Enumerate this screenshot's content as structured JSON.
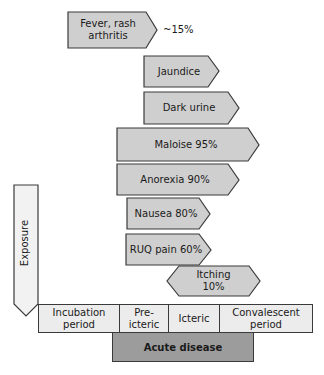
{
  "diagram": {
    "symptoms": [
      {
        "label": "Fever, rash\narthritis",
        "line1": "Fever, rash",
        "line2": "arthritis",
        "annotation": "~15%"
      },
      {
        "label": "Jaundice"
      },
      {
        "label": "Dark urine"
      },
      {
        "label": "Maloise 95%"
      },
      {
        "label": "Anorexia 90%"
      },
      {
        "label": "Nausea 80%"
      },
      {
        "label": "RUQ pain 60%"
      },
      {
        "label": "Itching 10%",
        "line1": "Itching",
        "line2": "10%"
      }
    ],
    "exposure": {
      "label": "Exposure"
    },
    "timeline": [
      {
        "line1": "Incubation",
        "line2": "period"
      },
      {
        "line1": "Pre-icteric"
      },
      {
        "line1": "Icteric"
      },
      {
        "line1": "Convalescent",
        "line2": "period"
      }
    ],
    "acute": {
      "label": "Acute disease"
    },
    "colors": {
      "shape_fill": "#cfcfcf",
      "cell_fill": "#ececec",
      "acute_fill": "#9c9c9c",
      "stroke": "#3a3a3a"
    }
  }
}
